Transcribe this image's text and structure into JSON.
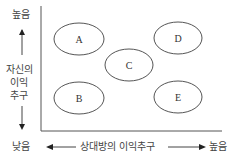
{
  "diagram": {
    "y_axis": {
      "high_label": "높음",
      "low_label": "낮음",
      "title_lines": [
        "자신의",
        "이익",
        "추구"
      ]
    },
    "x_axis": {
      "low_label": "낮음",
      "title": "상대방의 이익추구",
      "high_label": "높음"
    },
    "regions": [
      {
        "id": "A",
        "label": "A",
        "position": "top-left"
      },
      {
        "id": "D",
        "label": "D",
        "position": "top-right"
      },
      {
        "id": "C",
        "label": "C",
        "position": "center"
      },
      {
        "id": "B",
        "label": "B",
        "position": "bottom-left"
      },
      {
        "id": "E",
        "label": "E",
        "position": "bottom-right"
      }
    ]
  }
}
